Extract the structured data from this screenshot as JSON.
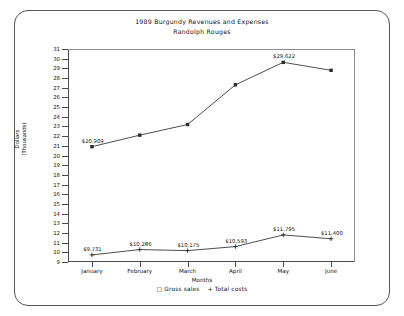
{
  "frame": {
    "shape": "rounded-rectangle-border"
  },
  "titles": {
    "title": "1989 Burgundy Revenues and Expenses",
    "subtitle": "Randolph Rouges"
  },
  "axes": {
    "ylabel_line1": "Dollars",
    "ylabel_line2": "(Thousands)",
    "ylabel": "Dollars (Thousands)",
    "xlabel": "Months"
  },
  "legend": {
    "marker_gross": "□",
    "gross_label": "Gross sales",
    "marker_costs": "+",
    "costs_label": "Total costs",
    "text": "□ Gross sales  + Total costs"
  },
  "chart_data": {
    "type": "line",
    "title": "1989 Burgundy Revenues and Expenses",
    "subtitle": "Randolph Rouges",
    "xlabel": "Months",
    "ylabel": "Dollars (Thousands)",
    "categories": [
      "January",
      "February",
      "March",
      "April",
      "May",
      "June"
    ],
    "ylim": [
      9,
      31
    ],
    "yticks": [
      9,
      10,
      11,
      12,
      13,
      14,
      15,
      16,
      17,
      18,
      19,
      20,
      21,
      22,
      23,
      24,
      25,
      26,
      27,
      28,
      29,
      30,
      31
    ],
    "grid": false,
    "legend_position": "bottom",
    "series": [
      {
        "name": "Gross sales",
        "marker": "square",
        "values": [
          20.909,
          22.1,
          23.2,
          27.3,
          29.622,
          28.8
        ],
        "labels": [
          "$20,909",
          "",
          "",
          "",
          "$29,622",
          ""
        ]
      },
      {
        "name": "Total costs",
        "marker": "plus",
        "values": [
          9.731,
          10.286,
          10.175,
          10.593,
          11.795,
          11.4
        ],
        "labels": [
          "$9,731",
          "$10,286",
          "$10,175",
          "$10,593",
          "$11,795",
          "$11,400"
        ]
      }
    ]
  }
}
